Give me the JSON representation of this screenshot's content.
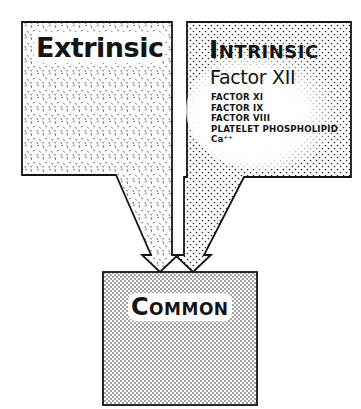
{
  "diagram": {
    "type": "flow",
    "nodes": [
      {
        "id": "extrinsic",
        "label": "Extrinsic",
        "fill_pattern": "dashes"
      },
      {
        "id": "intrinsic",
        "label": "Intrinsic",
        "fill_pattern": "dots",
        "items": [
          "Factor XII",
          "FACTOR XI",
          "FACTOR IX",
          "FACTOR VIII",
          "PLATELET PHOSPHOLIPID",
          "Ca++"
        ]
      },
      {
        "id": "common",
        "label": "Common",
        "fill_pattern": "fine-dots"
      }
    ],
    "edges": [
      {
        "from": "extrinsic",
        "to": "common",
        "style": "wide-arrow"
      },
      {
        "from": "intrinsic",
        "to": "common",
        "style": "wide-arrow"
      }
    ]
  },
  "extrinsic": {
    "title": "Extrinsic"
  },
  "intrinsic": {
    "title": "Intrinsic",
    "main_factor": "Factor XII",
    "factors": [
      "FACTOR XI",
      "FACTOR IX",
      "FACTOR VIII",
      "PLATELET PHOSPHOLIPID",
      "Ca⁺⁺"
    ]
  },
  "common": {
    "title": "Common"
  },
  "colors": {
    "ink": "#141414",
    "background": "#ffffff"
  }
}
